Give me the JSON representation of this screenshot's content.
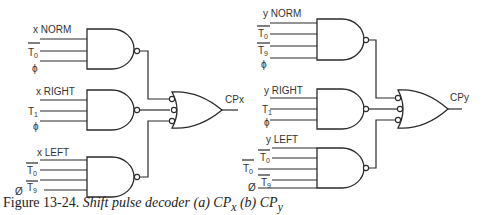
{
  "figure": {
    "caption_number": "Figure 13-24.",
    "caption_title": "Shift pulse decoder (a) CP",
    "caption_sub_a": "x",
    "caption_mid": " (b) CP",
    "caption_sub_b": "y"
  },
  "diagram_a": {
    "output_label": "CPx",
    "gates": [
      {
        "name": "norm",
        "label": "x NORM",
        "inputs": [
          "T0 (inverted)",
          "ϕ"
        ]
      },
      {
        "name": "right",
        "label": "x RIGHT",
        "inputs": [
          "T1",
          "ϕ"
        ]
      },
      {
        "name": "left",
        "label": "x LEFT",
        "inputs": [
          "T0 (inverted)",
          "T9 (inverted)",
          "ϕ"
        ]
      }
    ],
    "labels": {
      "norm": "x NORM",
      "right": "x RIGHT",
      "left": "x LEFT",
      "t0": "T",
      "t0_sub": "0",
      "t1": "T",
      "t1_sub": "1",
      "t9": "T",
      "t9_sub": "9",
      "phi": "ϕ",
      "phi_slash": "Ø"
    }
  },
  "diagram_b": {
    "output_label": "CPy",
    "gates": [
      {
        "name": "norm",
        "label": "y NORM",
        "inputs": [
          "T0 (inverted)",
          "T9 (inverted)",
          "ϕ"
        ]
      },
      {
        "name": "right",
        "label": "y RIGHT",
        "inputs": [
          "T1",
          "ϕ"
        ]
      },
      {
        "name": "left",
        "label": "y LEFT",
        "inputs": [
          "T0 (inverted)",
          "T0 (inverted)",
          "T9 (inverted)",
          "Ø"
        ]
      }
    ],
    "labels": {
      "norm": "y NORM",
      "right": "y RIGHT",
      "left": "y LEFT",
      "t0": "T",
      "t0_sub": "0",
      "t1": "T",
      "t1_sub": "1",
      "t9": "T",
      "t9_sub": "9",
      "phi": "ϕ",
      "phi_slash": "Ø"
    }
  }
}
